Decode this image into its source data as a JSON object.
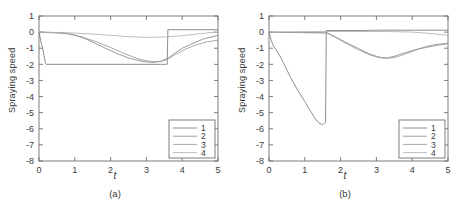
{
  "figure": {
    "panels": [
      {
        "id": "a",
        "caption": "(a)"
      },
      {
        "id": "b",
        "caption": "(b)"
      }
    ]
  },
  "chart_data": [
    {
      "type": "line",
      "panel": "a",
      "title": "",
      "caption": "(a)",
      "xlabel": "t",
      "ylabel": "Spraying speed",
      "xlim": [
        0,
        5
      ],
      "ylim": [
        -8,
        1
      ],
      "xticks": [
        0,
        1,
        2,
        3,
        4,
        5
      ],
      "xticklabels": [
        "0",
        "1",
        "2",
        "3",
        "4",
        "5"
      ],
      "yticks": [
        1,
        0,
        -1,
        -2,
        -3,
        -4,
        -5,
        -6,
        -7,
        -8
      ],
      "yticklabels": [
        "1",
        "0",
        "-1",
        "-2",
        "-3",
        "-4",
        "-5",
        "-6",
        "-7",
        "-8"
      ],
      "grid": false,
      "legend": {
        "position": "lower right",
        "entries": [
          "1",
          "2",
          "3",
          "4"
        ]
      },
      "series": [
        {
          "name": "1",
          "color": "#7a7a7a",
          "x": [
            0,
            0.05,
            0.1,
            0.14,
            0.18,
            0.2,
            0.6,
            1.0,
            1.5,
            2.0,
            2.5,
            3.0,
            3.4,
            3.58,
            3.6,
            3.8,
            4.2,
            4.6,
            5.0
          ],
          "y": [
            0,
            -0.55,
            -1.0,
            -1.45,
            -1.9,
            -2.0,
            -2.0,
            -2.0,
            -2.0,
            -2.0,
            -2.0,
            -2.0,
            -2.0,
            -2.0,
            0.15,
            0.15,
            0.15,
            0.15,
            0.15
          ]
        },
        {
          "name": "2",
          "color": "#8a8a8a",
          "x": [
            0,
            0.3,
            0.7,
            1.0,
            1.3,
            1.6,
            1.9,
            2.2,
            2.5,
            2.8,
            3.0,
            3.2,
            3.4,
            3.6,
            3.8,
            4.0,
            4.3,
            4.6,
            5.0
          ],
          "y": [
            0,
            -0.02,
            -0.05,
            -0.18,
            -0.42,
            -0.72,
            -1.05,
            -1.35,
            -1.6,
            -1.78,
            -1.85,
            -1.88,
            -1.82,
            -1.62,
            -1.3,
            -1.0,
            -0.7,
            -0.42,
            -0.2
          ]
        },
        {
          "name": "3",
          "color": "#9a9a9a",
          "x": [
            0,
            0.4,
            0.8,
            1.2,
            1.6,
            2.0,
            2.4,
            2.8,
            3.0,
            3.2,
            3.45,
            3.6,
            3.8,
            4.1,
            4.4,
            4.7,
            5.0
          ],
          "y": [
            0,
            -0.04,
            -0.1,
            -0.3,
            -0.6,
            -0.95,
            -1.35,
            -1.68,
            -1.78,
            -1.83,
            -1.8,
            -1.68,
            -1.4,
            -1.05,
            -0.78,
            -0.6,
            -0.5
          ]
        },
        {
          "name": "4",
          "color": "#b0b0b0",
          "x": [
            0,
            0.5,
            1.0,
            1.5,
            2.0,
            2.5,
            3.0,
            3.5,
            4.0,
            4.5,
            5.0
          ],
          "y": [
            0,
            -0.02,
            -0.06,
            -0.12,
            -0.2,
            -0.28,
            -0.33,
            -0.3,
            -0.22,
            -0.1,
            0.02
          ]
        }
      ]
    },
    {
      "type": "line",
      "panel": "b",
      "title": "",
      "caption": "(b)",
      "xlabel": "t",
      "ylabel": "Spraying speed",
      "xlim": [
        0,
        5
      ],
      "ylim": [
        -8,
        1
      ],
      "xticks": [
        0,
        1,
        2,
        3,
        4,
        5
      ],
      "xticklabels": [
        "0",
        "1",
        "2",
        "3",
        "4",
        "5"
      ],
      "yticks": [
        1,
        0,
        -1,
        -2,
        -3,
        -4,
        -5,
        -6,
        -7,
        -8
      ],
      "yticklabels": [
        "1",
        "0",
        "-1",
        "-2",
        "-3",
        "-4",
        "-5",
        "-6",
        "-7",
        "-8"
      ],
      "grid": false,
      "legend": {
        "position": "lower right",
        "entries": [
          "1",
          "2",
          "3",
          "4"
        ]
      },
      "series": [
        {
          "name": "1",
          "color": "#7a7a7a",
          "x": [
            0,
            0.06,
            0.12,
            0.2,
            0.3,
            0.4,
            0.5,
            0.6,
            0.7,
            0.8,
            0.9,
            1.0,
            1.1,
            1.2,
            1.3,
            1.4,
            1.5,
            1.58,
            1.6,
            1.8,
            2.2,
            2.6,
            3.0,
            3.5,
            4.0,
            4.5,
            5.0
          ],
          "y": [
            0,
            -0.5,
            -0.85,
            -1.1,
            -1.45,
            -1.9,
            -2.35,
            -2.8,
            -3.2,
            -3.6,
            -3.95,
            -4.3,
            -4.7,
            -5.05,
            -5.4,
            -5.65,
            -5.75,
            -5.6,
            0.1,
            0.1,
            0.1,
            0.1,
            0.12,
            0.12,
            0.12,
            0.12,
            0.12
          ]
        },
        {
          "name": "2",
          "color": "#8a8a8a",
          "x": [
            0,
            0.4,
            0.9,
            1.3,
            1.62,
            1.9,
            2.2,
            2.5,
            2.8,
            3.0,
            3.15,
            3.3,
            3.5,
            3.8,
            4.1,
            4.4,
            4.7,
            5.0
          ],
          "y": [
            0,
            -0.02,
            -0.03,
            -0.04,
            -0.05,
            -0.35,
            -0.7,
            -1.02,
            -1.35,
            -1.5,
            -1.58,
            -1.6,
            -1.5,
            -1.28,
            -1.08,
            -0.95,
            -0.82,
            -0.72
          ]
        },
        {
          "name": "3",
          "color": "#9a9a9a",
          "x": [
            0,
            0.5,
            1.0,
            1.5,
            1.62,
            1.9,
            2.2,
            2.5,
            2.8,
            3.05,
            3.25,
            3.45,
            3.7,
            4.0,
            4.3,
            4.6,
            5.0
          ],
          "y": [
            0,
            -0.02,
            -0.03,
            -0.04,
            -0.05,
            -0.38,
            -0.75,
            -1.1,
            -1.4,
            -1.58,
            -1.62,
            -1.6,
            -1.45,
            -1.2,
            -0.95,
            -0.78,
            -0.68
          ]
        },
        {
          "name": "4",
          "color": "#b0b0b0",
          "x": [
            0,
            0.5,
            1.0,
            1.5,
            2.0,
            2.5,
            3.0,
            3.5,
            4.0,
            4.5,
            5.0
          ],
          "y": [
            0,
            0.02,
            0.03,
            0.04,
            0.04,
            0.04,
            0.04,
            0.03,
            0.0,
            -0.08,
            -0.2
          ]
        }
      ]
    }
  ]
}
